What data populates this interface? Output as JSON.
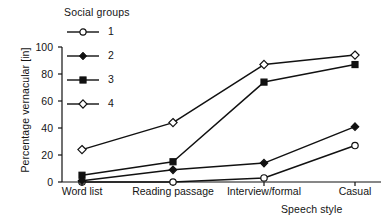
{
  "chart_data": {
    "type": "line",
    "title": "",
    "xlabel": "Speech style",
    "ylabel": "Percentage vernacular [in]",
    "legend_title": "Social groups",
    "legend_position": "top-left",
    "grid": false,
    "categories": [
      "Word list",
      "Reading passage",
      "Interview/formal",
      "Casual"
    ],
    "ylim": [
      0,
      100
    ],
    "yticks": [
      0,
      20,
      40,
      60,
      80,
      100
    ],
    "ytick_labels": [
      "0",
      "20",
      "40",
      "60",
      "80",
      "100"
    ],
    "series": [
      {
        "name": "1",
        "marker": "open-circle",
        "values": [
          0,
          0,
          3,
          27
        ]
      },
      {
        "name": "2",
        "marker": "filled-diamond",
        "values": [
          1,
          9,
          14,
          41
        ]
      },
      {
        "name": "3",
        "marker": "filled-square",
        "values": [
          5,
          15,
          74,
          87
        ]
      },
      {
        "name": "4",
        "marker": "open-diamond",
        "values": [
          24,
          44,
          87,
          94
        ]
      }
    ],
    "line_color": "#111111",
    "marker_fill_open": "#ffffff",
    "marker_fill_closed": "#111111"
  }
}
